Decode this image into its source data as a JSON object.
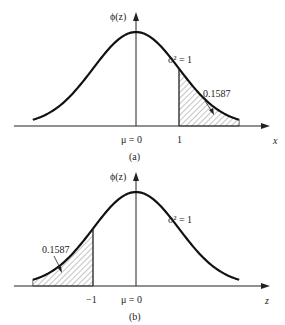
{
  "panels": [
    {
      "id": "a",
      "caption": "(a)",
      "y_label": "ϕ(z)",
      "x_label": "x",
      "mean_label": "μ = 0",
      "variance_label": "σ² = 1",
      "cut_value": 1,
      "cut_label": "1",
      "shaded_side": "right",
      "area_label": "0.1587"
    },
    {
      "id": "b",
      "caption": "(b)",
      "y_label": "ϕ(z)",
      "x_label": "z",
      "mean_label": "μ = 0",
      "variance_label": "σ² = 1",
      "cut_value": -1,
      "cut_label": "−1",
      "shaded_side": "left",
      "area_label": "0.1587"
    }
  ],
  "chart_data": [
    {
      "type": "line",
      "title": "(a)",
      "xlabel": "x",
      "ylabel": "ϕ(z)",
      "distribution": "standard normal",
      "mean": 0,
      "variance": 1,
      "shaded_region": {
        "from": 1,
        "to": "inf",
        "area": 0.1587
      },
      "x_ticks": [
        "μ = 0",
        "1"
      ]
    },
    {
      "type": "line",
      "title": "(b)",
      "xlabel": "z",
      "ylabel": "ϕ(z)",
      "distribution": "standard normal",
      "mean": 0,
      "variance": 1,
      "shaded_region": {
        "from": "-inf",
        "to": -1,
        "area": 0.1587
      },
      "x_ticks": [
        "−1",
        "μ = 0"
      ]
    }
  ]
}
